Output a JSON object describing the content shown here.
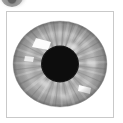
{
  "page": {
    "background_color": "#ffffff",
    "width": 123,
    "height": 123
  },
  "top_thumbnail": {
    "name": "cropped-iris-thumbnail",
    "description": "Partially visible grayscale iris thumbnail cropped by the top edge",
    "alt_text": "cropped circular grayscale eye thumbnail",
    "fill_color": "#9b9b9b",
    "core_color": "#5c5c5c"
  },
  "figure": {
    "name": "iris-figure",
    "caption": "",
    "frame": {
      "border_color": "#c9c9c9",
      "border_width_px": 1,
      "background_color": "#ffffff"
    },
    "iris": {
      "label": "iris",
      "outer_color": "#b4b4b4",
      "mid_color": "#a8a8a8",
      "rim_color": "#9e9e9e",
      "striation_color": "#c6c6c6",
      "highlight_color": "#fbfbfb",
      "collarette_color": "#8f8f8f",
      "radius_x_pct": 45,
      "radius_y_pct": 41
    },
    "pupil": {
      "label": "pupil",
      "color": "#0d0d0d",
      "radius_pct": 17
    },
    "highlights": [
      {
        "name": "specular-highlight-upper-left",
        "cx_pct": 30,
        "cy_pct": 30
      },
      {
        "name": "specular-highlight-lower-right",
        "cx_pct": 72,
        "cy_pct": 74
      },
      {
        "name": "specular-highlight-left",
        "cx_pct": 22,
        "cy_pct": 47
      }
    ]
  }
}
